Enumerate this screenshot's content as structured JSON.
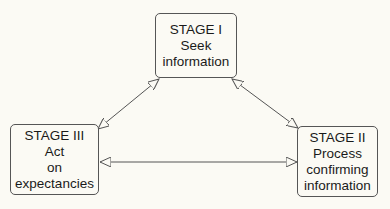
{
  "diagram": {
    "type": "cycle",
    "nodes": [
      {
        "id": "stage1",
        "title": "STAGE I",
        "lines": [
          "Seek",
          "information"
        ]
      },
      {
        "id": "stage2",
        "title": "STAGE II",
        "lines": [
          "Process",
          "confirming",
          "information"
        ]
      },
      {
        "id": "stage3",
        "title": "STAGE III",
        "lines": [
          "Act",
          "on",
          "expectancies"
        ]
      }
    ],
    "edges": [
      {
        "from": "stage1",
        "to": "stage3",
        "bidirectional": true
      },
      {
        "from": "stage1",
        "to": "stage2",
        "bidirectional": true
      },
      {
        "from": "stage3",
        "to": "stage2",
        "bidirectional": true
      }
    ],
    "colors": {
      "line": "#555555",
      "text": "#1a1a1a",
      "background": "#fbfaf4"
    }
  }
}
